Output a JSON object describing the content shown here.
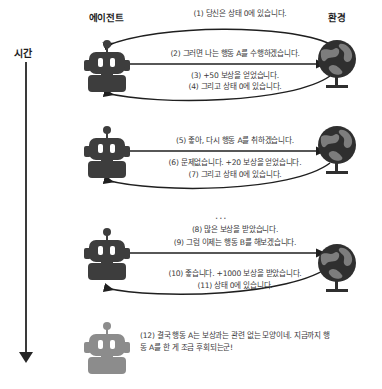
{
  "diagram": {
    "time_axis": {
      "label": "시간",
      "arrow_icon": "down-arrow-icon"
    },
    "columns": {
      "agent": {
        "label": "에이전트",
        "icon": "robot-icon"
      },
      "environment": {
        "label": "환경",
        "icon": "globe-icon"
      }
    },
    "ellipsis": "...",
    "messages": [
      {
        "id": "m1",
        "text": "(1) 당신은 상태 0에 있습니다.",
        "direction": "env-to-agent"
      },
      {
        "id": "m2",
        "text": "(2) 그러면 나는 행동 A를 수행하겠습니다.",
        "direction": "agent-to-env"
      },
      {
        "id": "m3",
        "text": "(3) +50 보상을 얻었습니다.",
        "direction": "env-to-agent"
      },
      {
        "id": "m4",
        "text": "(4) 그리고 상태 0에 있습니다.",
        "direction": "env-to-agent"
      },
      {
        "id": "m5",
        "text": "(5) 좋아, 다시 행동 A를 취하겠습니다.",
        "direction": "agent-to-env"
      },
      {
        "id": "m6",
        "text": "(6) 문제없습니다. +20 보상을 얻었습니다.",
        "direction": "env-to-agent"
      },
      {
        "id": "m7",
        "text": "(7) 그리고 상태 0에 있습니다.",
        "direction": "env-to-agent"
      },
      {
        "id": "m8",
        "text": "(8) 많은 보상을 받았습니다.",
        "direction": "agent-to-env"
      },
      {
        "id": "m9",
        "text": "(9) 그럼 이제는 행동 B를 해보겠습니다.",
        "direction": "agent-to-env"
      },
      {
        "id": "m10",
        "text": "(10) 좋습니다. +1000 보상을 받았습니다.",
        "direction": "env-to-agent"
      },
      {
        "id": "m11",
        "text": "(11) 상태 0에 있습니다.",
        "direction": "env-to-agent"
      },
      {
        "id": "m12",
        "text": "(12) 결국 행동 A는 보상과는 관련 없는 모양이네. 지금까지 행동 A를 한 게 조금 후회되는군!",
        "direction": "agent-thought"
      }
    ]
  },
  "colors": {
    "ink": "#3d3d3d",
    "ink_light": "#8c8c8c",
    "globe_dark": "#2f2f2f",
    "globe_land": "#7d7d7d",
    "arrow": "#1f1f1f",
    "text": "#3a3a3a"
  }
}
